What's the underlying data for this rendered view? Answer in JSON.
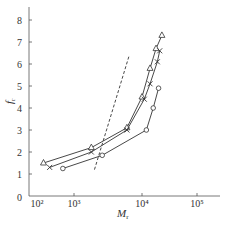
{
  "chart_data": {
    "type": "line",
    "title": "",
    "xlabel": "M_r",
    "ylabel": "f_r",
    "xscale": "log",
    "xlim": [
      100,
      200000
    ],
    "ylim": [
      0,
      8.5
    ],
    "xticks": [
      "10²",
      "10³",
      "10⁴",
      "10⁵"
    ],
    "yticks": [
      "0",
      "1",
      "2",
      "3",
      "4",
      "5",
      "6",
      "7",
      "8"
    ],
    "grid": false,
    "legend": "none",
    "series": [
      {
        "name": "triangle",
        "marker": "triangle",
        "points": [
          [
            150,
            1.5
          ],
          [
            1800,
            2.2
          ],
          [
            6000,
            3.1
          ],
          [
            10000,
            4.5
          ],
          [
            14000,
            5.8
          ],
          [
            18000,
            6.7
          ],
          [
            23000,
            7.3
          ]
        ]
      },
      {
        "name": "cross",
        "marker": "x",
        "points": [
          [
            220,
            1.3
          ],
          [
            1800,
            2.0
          ],
          [
            6000,
            3.0
          ],
          [
            11000,
            4.4
          ],
          [
            14000,
            5.1
          ],
          [
            19000,
            6.1
          ],
          [
            21000,
            6.6
          ]
        ]
      },
      {
        "name": "circle",
        "marker": "circle",
        "points": [
          [
            500,
            1.25
          ],
          [
            2600,
            1.85
          ],
          [
            12000,
            3.0
          ],
          [
            16000,
            4.0
          ],
          [
            20000,
            4.9
          ]
        ]
      },
      {
        "name": "dashed",
        "marker": "none",
        "style": "dashed",
        "points": [
          [
            2000,
            1.2
          ],
          [
            6500,
            6.4
          ]
        ]
      }
    ]
  },
  "axes": {
    "x_label_main": "M",
    "x_label_sub": "r",
    "y_label_main": "f",
    "y_label_sub": "r",
    "zero_label": "0"
  }
}
